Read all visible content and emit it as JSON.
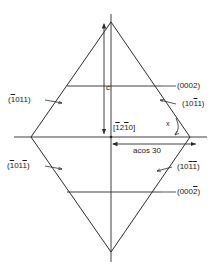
{
  "figure": {
    "type": "crystallographic-hexagonal-bipyramid-cross-section",
    "background_color": "#ffffff",
    "line_color": "#2b2b2b",
    "text_color": "#1a1a1a"
  },
  "labels": {
    "basal_top": "(0002)",
    "basal_bottom_pre": "(000",
    "basal_bottom_bar": "2",
    "basal_bottom_post": ")",
    "pyramid_upper_left_open": "(",
    "pyramid_upper_left_bar": "1",
    "pyramid_upper_left_rest": "011)",
    "pyramid_upper_right_open": "(10",
    "pyramid_upper_right_bar": "1",
    "pyramid_upper_right_rest": "1)",
    "pyramid_lower_left_open": "(",
    "pyramid_lower_left_bar1": "1",
    "pyramid_lower_left_mid": "01",
    "pyramid_lower_left_bar2": "1",
    "pyramid_lower_left_close": ")",
    "pyramid_lower_right_open": "(10",
    "pyramid_lower_right_bar1": "1",
    "pyramid_lower_right_bar2": "1",
    "pyramid_lower_right_close": ")",
    "direction_open": "[",
    "direction_bar1": "1",
    "direction_mid": "2",
    "direction_bar2": "1",
    "direction_rest": "0]",
    "c_axis": "c",
    "a_dimension": "acos 30",
    "angle_x": "x"
  },
  "geometry": {
    "apex_top_x": 111,
    "apex_top_y": 22,
    "apex_bottom_x": 111,
    "apex_bottom_y": 252,
    "waist_left_x": 31,
    "waist_right_x": 190,
    "waist_y": 137,
    "basal_top_y": 86,
    "basal_bottom_y": 192
  }
}
